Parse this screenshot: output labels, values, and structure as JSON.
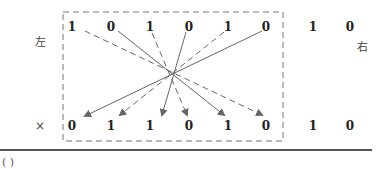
{
  "diagram": {
    "left_label": "左",
    "right_label": "右",
    "multiply_sign": "×",
    "answer_blank": "(      )",
    "top_row": [
      "1",
      "0",
      "1",
      "0",
      "1",
      "0",
      "1",
      "0"
    ],
    "bottom_row": [
      "0",
      "1",
      "1",
      "0",
      "1",
      "0",
      "1",
      "0"
    ],
    "boxed_count": 6,
    "mappings": [
      {
        "from_top_index": 0,
        "to_bottom_index": 5,
        "style": "dashed"
      },
      {
        "from_top_index": 1,
        "to_bottom_index": 4,
        "style": "solid"
      },
      {
        "from_top_index": 2,
        "to_bottom_index": 3,
        "style": "dashed"
      },
      {
        "from_top_index": 3,
        "to_bottom_index": 2,
        "style": "solid"
      },
      {
        "from_top_index": 4,
        "to_bottom_index": 1,
        "style": "dashed"
      },
      {
        "from_top_index": 5,
        "to_bottom_index": 0,
        "style": "solid"
      }
    ],
    "colors": {
      "line": "#666666",
      "box": "#777777",
      "text": "#222222"
    }
  }
}
